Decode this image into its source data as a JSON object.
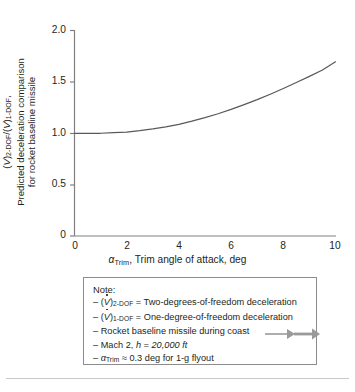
{
  "chart_data": {
    "type": "line",
    "title": "",
    "xlabel": "α_Trim, Trim angle of attack, deg",
    "ylabel": "(V̇)_2-DOF/(V̇)_1-DOF, Predicted deceleration comparison for rocket baseline missile",
    "xlim": [
      0,
      10
    ],
    "ylim": [
      0,
      2.0
    ],
    "grid": false,
    "legend": "none",
    "x_ticks": [
      "0",
      "2",
      "4",
      "6",
      "8",
      "10"
    ],
    "x_tick_values": [
      0,
      2,
      4,
      6,
      8,
      10
    ],
    "y_ticks": [
      "0",
      "0.5",
      "1.0",
      "1.5",
      "2.0"
    ],
    "y_tick_values": [
      0,
      0.5,
      1.0,
      1.5,
      2.0
    ],
    "series": [
      {
        "name": "(V̇)2-DOF/(V̇)1-DOF",
        "color": "#59595b",
        "x": [
          0,
          0.5,
          1,
          1.5,
          2,
          2.5,
          3,
          3.5,
          4,
          4.5,
          5,
          5.5,
          6,
          6.5,
          7,
          7.5,
          8,
          8.5,
          9,
          9.5,
          10
        ],
        "values": [
          1.0,
          1.0,
          1.0,
          1.005,
          1.012,
          1.025,
          1.042,
          1.062,
          1.087,
          1.118,
          1.152,
          1.19,
          1.232,
          1.278,
          1.327,
          1.38,
          1.436,
          1.494,
          1.553,
          1.615,
          1.695
        ]
      }
    ]
  },
  "axes": {
    "y_label_line1": "(V)2-DOF /(V)1-DOF ,",
    "y_label_line2_a": "Predicted deceleration comparison",
    "y_label_line2_b": "for rocket baseline missile",
    "y_tick_labels": [
      "2.0",
      "1.5",
      "1.0",
      "0.5",
      "0"
    ],
    "x_tick_labels": [
      "0",
      "2",
      "4",
      "6",
      "8",
      "10"
    ],
    "x_title_symbol": "α",
    "x_title_sub": "Trim",
    "x_title_rest": ", Trim angle of attack, deg"
  },
  "note": {
    "title": "Note:",
    "lines": [
      {
        "dash": "–",
        "text_a": "(V)",
        "sub_a": "2-DOF",
        "text_b": " = Two-degrees-of-freedom deceleration"
      },
      {
        "dash": "–",
        "text_a": "(V)",
        "sub_a": "1-DOF",
        "text_b": " = One-degree-of-freedom deceleration"
      },
      {
        "dash": "–",
        "text_a": "Rocket baseline missile during coast",
        "sub_a": "",
        "text_b": ""
      },
      {
        "dash": "–",
        "text_a": "Mach 2, ",
        "sub_a": "",
        "text_b": "h = 20,000 ft"
      },
      {
        "dash": "–",
        "text_a": "α",
        "sub_a": "Trim",
        "text_b": " ≈ 0.3 deg for 1-g flyout"
      }
    ],
    "missile_icon": "missile-left-arrow-icon"
  },
  "colors": {
    "curve": "#59595b",
    "axis": "#808080",
    "text": "#231f20",
    "note_border": "#8c8c8c",
    "missile": "#9a9a9a",
    "footer_rule": "#c9c9c9"
  }
}
